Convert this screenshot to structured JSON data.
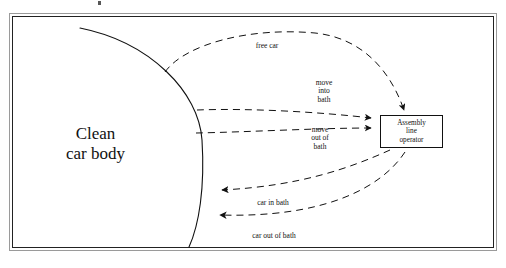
{
  "diagram": {
    "title_fragment_visible": "",
    "entity_left": {
      "name": "clean-car-body",
      "line1": "Clean",
      "line2": "car body"
    },
    "entity_right": {
      "name": "assembly-line-operator",
      "line1": "Assembly",
      "line2": "line",
      "line3": "operator"
    },
    "flows": [
      {
        "id": "free-car",
        "label": "free car",
        "direction": "left-to-right"
      },
      {
        "id": "move-into-bath",
        "label_line1": "move",
        "label_line2": "into",
        "label_line3": "bath",
        "direction": "right-to-left"
      },
      {
        "id": "move-out-bath",
        "label_line1": "move",
        "label_line2": "out of",
        "label_line3": "bath",
        "direction": "right-to-left"
      },
      {
        "id": "car-in-bath",
        "label": "car in bath",
        "direction": "right-to-left"
      },
      {
        "id": "car-out-bath",
        "label": "car out of bath",
        "direction": "right-to-left"
      }
    ],
    "colors": {
      "ink": "#111111",
      "frame_outer": "#9a9a9a",
      "frame_inner": "#222222",
      "background": "#ffffff"
    }
  }
}
